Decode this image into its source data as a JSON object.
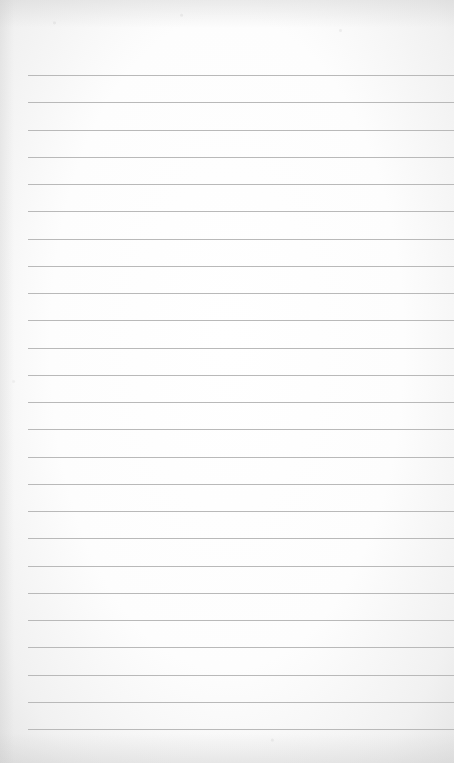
{
  "page": {
    "type": "lined-paper",
    "line_count": 25,
    "line_color": "#b9b9b9",
    "paper_color": "#fdfdfd",
    "text": ""
  }
}
